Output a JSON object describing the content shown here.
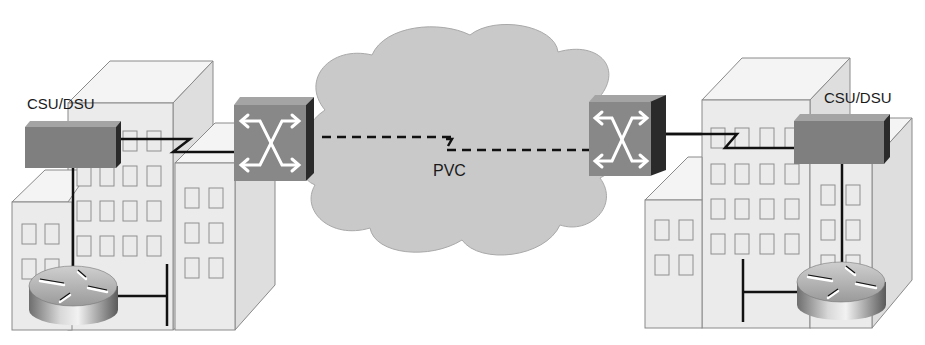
{
  "diagram": {
    "type": "network-topology",
    "colors": {
      "background": "#ffffff",
      "building_front": "#ebebeb",
      "building_top": "#f4f4f4",
      "building_side": "#dedede",
      "building_stroke": "#8a8a8a",
      "window_stroke": "#8f8f8f",
      "cloud_fill": "#c9c9c9",
      "cloud_stroke": "#a9a9a9",
      "device_front": "#7f7f7f",
      "device_top": "#a4a4a4",
      "device_side": "#2a2a2a",
      "switch_front": "#888888",
      "cable": "#111111"
    },
    "left_site": {
      "csu_dsu_label": "CSU/DSU",
      "devices": [
        "router",
        "csu-dsu"
      ]
    },
    "right_site": {
      "csu_dsu_label": "CSU/DSU",
      "devices": [
        "router",
        "csu-dsu"
      ]
    },
    "cloud": {
      "name": "frame-relay-cloud",
      "switches": [
        "left-wan-switch",
        "right-wan-switch"
      ],
      "circuit_label": "PVC"
    },
    "links": [
      {
        "from": "left-router",
        "to": "left-csu-dsu",
        "style": "solid"
      },
      {
        "from": "left-router",
        "to": "left-lan",
        "style": "solid"
      },
      {
        "from": "left-csu-dsu",
        "to": "left-wan-switch",
        "style": "serial"
      },
      {
        "from": "left-wan-switch",
        "to": "right-wan-switch",
        "style": "dashed",
        "label": "PVC"
      },
      {
        "from": "right-wan-switch",
        "to": "right-csu-dsu",
        "style": "serial"
      },
      {
        "from": "right-csu-dsu",
        "to": "right-router",
        "style": "solid"
      },
      {
        "from": "right-router",
        "to": "right-lan",
        "style": "solid"
      }
    ]
  }
}
